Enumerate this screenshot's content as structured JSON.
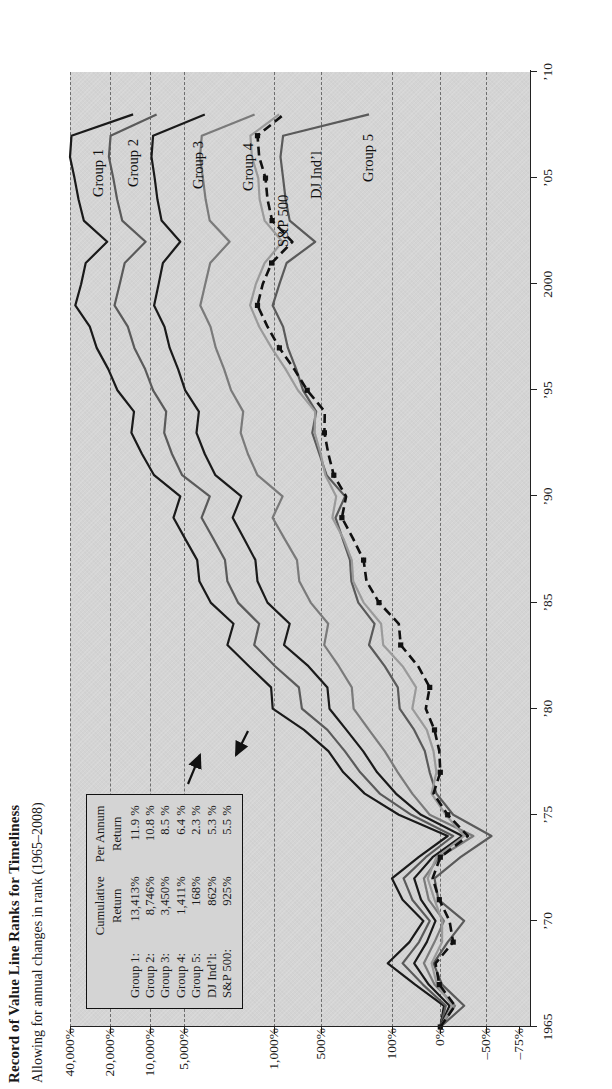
{
  "header": {
    "title": "Record of Value Line Ranks for Timeliness",
    "subtitle": "Allowing for annual changes in rank (1965–2008)"
  },
  "legend": {
    "col_head_1_line1": "Cumulative",
    "col_head_1_line2": "Return",
    "col_head_2_line1": "Per Annum",
    "col_head_2_line2": "Return",
    "rows": [
      {
        "name": "Group 1:",
        "cumulative": "13,413%",
        "per_annum": "11.9 %"
      },
      {
        "name": "Group 2:",
        "cumulative": "8,746%",
        "per_annum": "10.8 %"
      },
      {
        "name": "Group 3:",
        "cumulative": "3,450%",
        "per_annum": "8.5 %"
      },
      {
        "name": "Group 4:",
        "cumulative": "1,411%",
        "per_annum": "6.4 %"
      },
      {
        "name": "Group 5:",
        "cumulative": "168%",
        "per_annum": "2.3 %"
      },
      {
        "name": "DJ Ind’l:",
        "cumulative": "862%",
        "per_annum": "5.3 %"
      },
      {
        "name": "S&P 500:",
        "cumulative": "925%",
        "per_annum": "5.5 %"
      }
    ]
  },
  "series_labels": [
    {
      "key": "group1",
      "text": "Group 1"
    },
    {
      "key": "group2",
      "text": "Group 2"
    },
    {
      "key": "group3",
      "text": "Group 3"
    },
    {
      "key": "group4",
      "text": "Group 4"
    },
    {
      "key": "sp500",
      "text": "S&P 500"
    },
    {
      "key": "dj",
      "text": "DJ Ind’l"
    },
    {
      "key": "group5",
      "text": "Group 5"
    }
  ],
  "colors": {
    "plot_background": "#d4d4d4",
    "gridline": "#6d6d6d",
    "axis": "#222222",
    "group1": "#1a1a1a",
    "group2": "#5a5a5a",
    "group3": "#1a1a1a",
    "group4": "#7a7a7a",
    "group5": "#5a5a5a",
    "sp500": "#9a9a9a",
    "dj": "#111111"
  },
  "chart_data": {
    "type": "line",
    "title": "Record of Value Line Ranks for Timeliness",
    "subtitle": "Allowing for annual changes in rank (1965–2008)",
    "xlabel": "",
    "ylabel": "",
    "xlim": [
      1965,
      2010
    ],
    "ylim": [
      -75,
      40000
    ],
    "yscale": "log-like (custom compressed)",
    "grid": true,
    "legend_position": "inside-left",
    "xticks": [
      1965,
      1970,
      1975,
      1980,
      1985,
      1990,
      1995,
      2000,
      2005,
      2010
    ],
    "xticklabels": [
      "1965",
      "’70",
      "’75",
      "’80",
      "’85",
      "’90",
      "’95",
      "2000",
      "’05",
      "’10"
    ],
    "yticks": [
      40000,
      20000,
      10000,
      5000,
      1000,
      500,
      100,
      0,
      -50,
      -75
    ],
    "yticklabels": [
      "40,000%",
      "20,000%",
      "10,000%",
      "5,000%",
      "1,000%",
      "500%",
      "100%",
      "0%",
      "–50%",
      "–75%"
    ],
    "x": [
      1965,
      1966,
      1967,
      1968,
      1969,
      1970,
      1971,
      1972,
      1973,
      1974,
      1975,
      1976,
      1977,
      1978,
      1979,
      1980,
      1981,
      1982,
      1983,
      1984,
      1985,
      1986,
      1987,
      1988,
      1989,
      1990,
      1991,
      1992,
      1993,
      1994,
      1995,
      1996,
      1997,
      1998,
      1999,
      2000,
      2001,
      2002,
      2003,
      2004,
      2005,
      2006,
      2007,
      2008
    ],
    "series": [
      {
        "name": "Group 1",
        "style": "solid",
        "color": "#1a1a1a",
        "marker": "none",
        "values": [
          0,
          -4,
          52,
          110,
          64,
          35,
          78,
          100,
          45,
          -8,
          86,
          185,
          300,
          420,
          640,
          1020,
          1050,
          1560,
          2300,
          2060,
          3100,
          3800,
          3950,
          4900,
          6200,
          5400,
          9200,
          11500,
          13800,
          13200,
          17600,
          20600,
          25200,
          28400,
          36500,
          33000,
          30500,
          21000,
          31500,
          34500,
          37000,
          40000,
          39000,
          13413
        ]
      },
      {
        "name": "Group 2",
        "style": "solid",
        "color": "#5a5a5a",
        "marker": "none",
        "values": [
          0,
          -6,
          36,
          78,
          44,
          22,
          58,
          76,
          30,
          -14,
          60,
          132,
          205,
          290,
          430,
          660,
          690,
          980,
          1420,
          1300,
          1900,
          2300,
          2400,
          2950,
          3650,
          3150,
          5200,
          6400,
          7500,
          7200,
          9400,
          10900,
          13100,
          14700,
          18500,
          16900,
          15500,
          10800,
          16200,
          17700,
          18900,
          20400,
          19800,
          8746
        ]
      },
      {
        "name": "Group 3",
        "style": "solid",
        "color": "#1a1a1a",
        "marker": "none",
        "values": [
          0,
          -10,
          24,
          54,
          28,
          10,
          40,
          54,
          16,
          -24,
          40,
          92,
          140,
          192,
          280,
          410,
          430,
          600,
          860,
          790,
          1120,
          1340,
          1390,
          1700,
          2090,
          1790,
          2850,
          3450,
          4000,
          3830,
          4900,
          5650,
          6700,
          7450,
          9200,
          8400,
          7700,
          5400,
          7900,
          8600,
          9100,
          9700,
          9400,
          3450
        ]
      },
      {
        "name": "Group 4",
        "style": "solid",
        "color": "#7a7a7a",
        "marker": "none",
        "values": [
          0,
          -16,
          12,
          34,
          12,
          -4,
          24,
          34,
          2,
          -36,
          22,
          58,
          88,
          118,
          168,
          238,
          248,
          332,
          462,
          422,
          580,
          686,
          710,
          852,
          1022,
          878,
          1340,
          1590,
          1810,
          1730,
          2150,
          2440,
          2830,
          3110,
          3740,
          3420,
          3130,
          2210,
          3160,
          3400,
          3570,
          3760,
          3640,
          1411
        ]
      },
      {
        "name": "Group 5",
        "style": "solid",
        "color": "#5a5a5a",
        "marker": "none",
        "values": [
          0,
          -26,
          -2,
          14,
          -8,
          -26,
          4,
          12,
          -22,
          -54,
          -14,
          8,
          22,
          32,
          54,
          84,
          88,
          118,
          168,
          148,
          214,
          250,
          258,
          304,
          358,
          288,
          438,
          510,
          566,
          534,
          648,
          718,
          812,
          872,
          1020,
          920,
          828,
          542,
          790,
          840,
          872,
          906,
          872,
          168
        ]
      },
      {
        "name": "S&P 500",
        "style": "solid-light",
        "color": "#9a9a9a",
        "marker": "none",
        "values": [
          0,
          -13,
          7,
          18,
          -2,
          -2,
          12,
          26,
          8,
          -26,
          -6,
          18,
          8,
          14,
          28,
          58,
          50,
          78,
          122,
          128,
          190,
          240,
          248,
          298,
          384,
          352,
          450,
          500,
          546,
          542,
          700,
          840,
          1040,
          1300,
          1530,
          1380,
          1180,
          880,
          1180,
          1290,
          1320,
          1480,
          1520,
          925
        ]
      },
      {
        "name": "DJ Ind’l",
        "style": "dashed",
        "color": "#111111",
        "marker": "square",
        "values": [
          0,
          -16,
          2,
          10,
          -14,
          -10,
          2,
          16,
          0,
          -30,
          -8,
          14,
          0,
          2,
          12,
          30,
          22,
          46,
          82,
          86,
          134,
          178,
          190,
          240,
          310,
          282,
          372,
          420,
          460,
          456,
          610,
          740,
          920,
          1120,
          1340,
          1220,
          1040,
          760,
          1030,
          1120,
          1160,
          1300,
          1340,
          862
        ]
      }
    ],
    "annotations": [
      {
        "text": "S&P 500",
        "points_to": "S&P 500 line"
      },
      {
        "text": "DJ Ind’l",
        "points_to": "DJ Ind’l line"
      }
    ]
  }
}
